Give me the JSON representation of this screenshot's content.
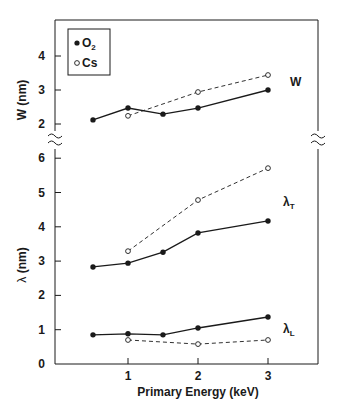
{
  "chart_data": {
    "type": "line",
    "xlabel": "Primary Energy (keV)",
    "x_ticks": [
      1,
      2,
      3
    ],
    "xlim": [
      0,
      3.7
    ],
    "legend": [
      {
        "name": "O2",
        "marker": "filled-circle",
        "line": "solid"
      },
      {
        "name": "Cs",
        "marker": "open-circle",
        "line": "dashed"
      }
    ],
    "legend_position": "upper-left",
    "panels": [
      {
        "name": "W",
        "ylabel": "W (nm)",
        "y_ticks": [
          2,
          3,
          4
        ],
        "ylim": [
          1.7,
          4.9
        ],
        "label": "W",
        "series": [
          {
            "name": "O2",
            "x": [
              0.5,
              1,
              1.5,
              2,
              3
            ],
            "values": [
              2.12,
              2.47,
              2.29,
              2.47,
              3.0
            ]
          },
          {
            "name": "Cs",
            "x": [
              1,
              2,
              3
            ],
            "values": [
              2.24,
              2.94,
              3.44
            ]
          }
        ]
      },
      {
        "name": "lambda",
        "ylabel": "λ (nm)",
        "y_ticks": [
          0,
          1,
          2,
          3,
          4,
          5,
          6
        ],
        "ylim": [
          0,
          6.3
        ],
        "curves": [
          {
            "label": "λT",
            "series": [
              {
                "name": "O2",
                "x": [
                  0.5,
                  1,
                  1.5,
                  2,
                  3
                ],
                "values": [
                  2.83,
                  2.94,
                  3.26,
                  3.82,
                  4.17
                ]
              },
              {
                "name": "Cs",
                "x": [
                  1,
                  2,
                  3
                ],
                "values": [
                  3.29,
                  4.78,
                  5.71
                ]
              }
            ]
          },
          {
            "label": "λL",
            "series": [
              {
                "name": "O2",
                "x": [
                  0.5,
                  1,
                  1.5,
                  2,
                  3
                ],
                "values": [
                  0.85,
                  0.88,
                  0.85,
                  1.05,
                  1.37
                ]
              },
              {
                "name": "Cs",
                "x": [
                  1,
                  2,
                  3
                ],
                "values": [
                  0.7,
                  0.58,
                  0.7
                ]
              }
            ]
          }
        ]
      }
    ],
    "axis_break": "between W=2 and λ=6 on both left and right axes",
    "grid": false
  },
  "labels": {
    "xlabel": "Primary Energy (keV)",
    "ylabel_w": "W (nm)",
    "ylabel_lambda_prefix": "λ",
    "ylabel_lambda_suffix": " (nm)",
    "legend_o2_base": "O",
    "legend_o2_sub": "2",
    "legend_cs": "Cs",
    "series_w": "W",
    "series_lt_base": "λ",
    "series_lt_sub": "T",
    "series_ll_base": "λ",
    "series_ll_sub": "L"
  },
  "colors": {
    "ink": "#1a1a1a",
    "background": "#ffffff"
  }
}
